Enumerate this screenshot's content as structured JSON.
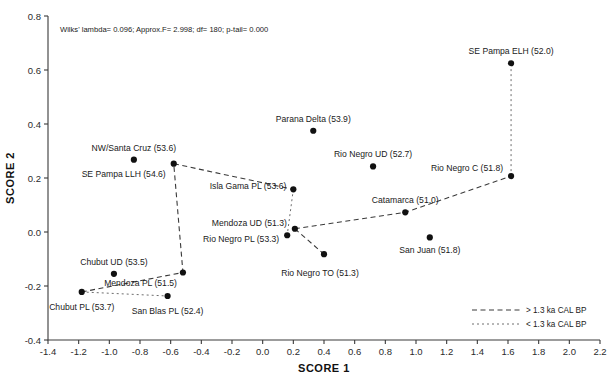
{
  "chart_data": {
    "type": "scatter",
    "title": "",
    "xlabel": "SCORE 1",
    "ylabel": "SCORE 2",
    "xlim": [
      -1.4,
      2.2
    ],
    "ylim": [
      -0.4,
      0.8
    ],
    "xticks": [
      "-1.4",
      "-1.2",
      "-1.0",
      "-0.8",
      "-0.6",
      "-0.4",
      "-0.2",
      "0.0",
      "0.2",
      "0.4",
      "0.6",
      "0.8",
      "1.0",
      "1.2",
      "1.4",
      "1.6",
      "1.8",
      "2.0",
      "2.2"
    ],
    "yticks": [
      "0.8",
      "0.6",
      "0.4",
      "0.2",
      "0.0",
      "-0.2",
      "-0.4"
    ],
    "grid": false,
    "annotation": "Wilks' lambda= 0.096; Approx.F= 2.998; df= 180; p-tail= 0.000",
    "legend_position": "bottom-right",
    "legend": [
      {
        "label": "> 1.3 ka CAL BP",
        "style": "dashed-dark"
      },
      {
        "label": "< 1.3 ka CAL BP",
        "style": "dotted-grey"
      }
    ],
    "points": [
      {
        "name": "SE Pampa ELH (52.0)",
        "x": 1.62,
        "y": 0.625,
        "label_dx": 0,
        "label_dy": -9,
        "anchor": "middle"
      },
      {
        "name": "Parana Delta (53.9)",
        "x": 0.33,
        "y": 0.375,
        "label_dx": 0,
        "label_dy": -9,
        "anchor": "middle"
      },
      {
        "name": "NW/Santa Cruz (53.6)",
        "x": -0.84,
        "y": 0.268,
        "label_dx": 0,
        "label_dy": -9,
        "anchor": "middle"
      },
      {
        "name": "Rio Negro UD (52.7)",
        "x": 0.72,
        "y": 0.243,
        "label_dx": 0,
        "label_dy": -9,
        "anchor": "middle"
      },
      {
        "name": "SE Pampa LLH (54.6)",
        "x": -0.58,
        "y": 0.253,
        "label_dx": -8,
        "label_dy": 13,
        "anchor": "end"
      },
      {
        "name": "Rio Negro C (51.8)",
        "x": 1.62,
        "y": 0.207,
        "label_dx": -8,
        "label_dy": -5,
        "anchor": "end"
      },
      {
        "name": "Isla Gama PL (53.6)",
        "x": 0.2,
        "y": 0.158,
        "label_dx": -7,
        "label_dy": 0,
        "anchor": "end"
      },
      {
        "name": "Catamarca (51.0)",
        "x": 0.93,
        "y": 0.073,
        "label_dx": 0,
        "label_dy": -9,
        "anchor": "middle"
      },
      {
        "name": "Mendoza UD (51.3)",
        "x": 0.21,
        "y": 0.012,
        "label_dx": -8,
        "label_dy": -3,
        "anchor": "end"
      },
      {
        "name": "Rio Negro PL (53.3)",
        "x": 0.16,
        "y": -0.012,
        "label_dx": -8,
        "label_dy": 7,
        "anchor": "end"
      },
      {
        "name": "San Juan (51.8)",
        "x": 1.09,
        "y": -0.02,
        "label_dx": 0,
        "label_dy": 16,
        "anchor": "middle"
      },
      {
        "name": "Rio Negro TO (51.3)",
        "x": 0.4,
        "y": -0.082,
        "label_dx": -4,
        "label_dy": 22,
        "anchor": "middle"
      },
      {
        "name": "Mendoza PL (51.5)",
        "x": -0.52,
        "y": -0.15,
        "label_dx": -6,
        "label_dy": 13,
        "anchor": "end"
      },
      {
        "name": "Chubut UD (53.5)",
        "x": -0.97,
        "y": -0.155,
        "label_dx": 0,
        "label_dy": -9,
        "anchor": "middle"
      },
      {
        "name": "Chubut PL (53.7)",
        "x": -1.18,
        "y": -0.222,
        "label_dx": 0,
        "label_dy": 18,
        "anchor": "middle"
      },
      {
        "name": "San Blas PL (52.4)",
        "x": -0.62,
        "y": -0.237,
        "label_dx": 0,
        "label_dy": 18,
        "anchor": "middle"
      }
    ],
    "connections_old": [
      [
        [
          -1.18,
          -0.222
        ],
        [
          -0.52,
          -0.15
        ],
        [
          -0.58,
          0.253
        ],
        [
          0.2,
          0.158
        ]
      ],
      [
        [
          0.21,
          0.012
        ],
        [
          0.93,
          0.073
        ],
        [
          1.62,
          0.207
        ]
      ],
      [
        [
          0.21,
          0.012
        ],
        [
          0.4,
          -0.082
        ]
      ]
    ],
    "connections_new": [
      [
        [
          1.62,
          0.207
        ],
        [
          1.62,
          0.625
        ]
      ],
      [
        [
          -1.18,
          -0.222
        ],
        [
          -0.62,
          -0.237
        ]
      ],
      [
        [
          0.2,
          0.158
        ],
        [
          0.16,
          -0.012
        ]
      ]
    ]
  }
}
